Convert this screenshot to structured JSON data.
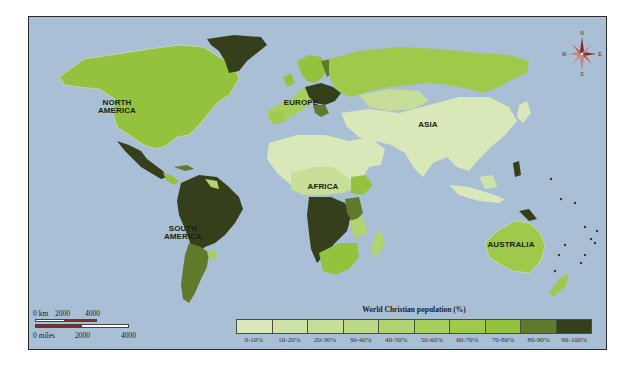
{
  "map": {
    "title": "World Christian population (%)",
    "ocean_color": "#a9bfd6",
    "continent_labels": [
      {
        "id": "north-america",
        "lines": [
          "NORTH",
          "AMERICA"
        ]
      },
      {
        "id": "south-america",
        "lines": [
          "SOUTH",
          "AMERICA"
        ]
      },
      {
        "id": "europe",
        "lines": [
          "EUROPE"
        ]
      },
      {
        "id": "asia",
        "lines": [
          "ASIA"
        ]
      },
      {
        "id": "africa",
        "lines": [
          "AFRICA"
        ]
      },
      {
        "id": "australia",
        "lines": [
          "AUSTRALIA"
        ]
      }
    ],
    "compass": {
      "n": "N",
      "s": "S",
      "e": "E",
      "w": "W"
    }
  },
  "legend": {
    "title": "World Christian population (%)",
    "classes": [
      {
        "label": "0-10%",
        "color": "#d9e8b8"
      },
      {
        "label": "10-20%",
        "color": "#cfe3a8"
      },
      {
        "label": "20-30%",
        "color": "#c7dd98"
      },
      {
        "label": "30-40%",
        "color": "#bcd985"
      },
      {
        "label": "40-50%",
        "color": "#b2d470"
      },
      {
        "label": "50-60%",
        "color": "#a8cf5c"
      },
      {
        "label": "60-70%",
        "color": "#9ec94a"
      },
      {
        "label": "70-80%",
        "color": "#93c23f"
      },
      {
        "label": "80-90%",
        "color": "#5e7a2a"
      },
      {
        "label": "90-100%",
        "color": "#363f1c"
      }
    ]
  },
  "scale_bar": {
    "km_label": "0 km",
    "km_mid": "2000",
    "km_end": "4000",
    "miles_label": "0 miles",
    "miles_mid": "2000",
    "miles_end": "4000",
    "bar_color": "#8c2a22"
  }
}
